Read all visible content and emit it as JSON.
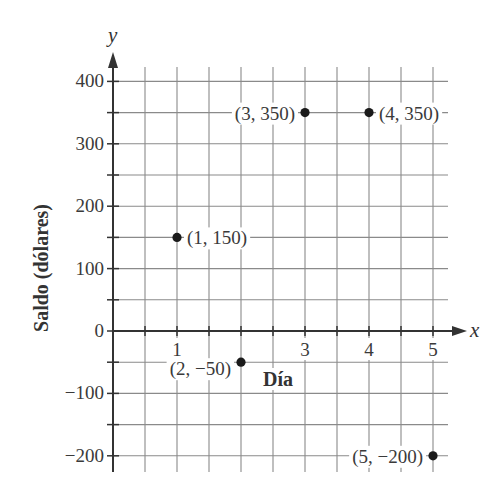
{
  "chart_data": {
    "type": "scatter",
    "title": "",
    "xlabel": "Día",
    "ylabel": "Saldo (dólares)",
    "x_axis_var": "x",
    "y_axis_var": "y",
    "xlim": [
      0,
      5.5
    ],
    "ylim": [
      -225,
      425
    ],
    "x_ticks": [
      1,
      3,
      4,
      5
    ],
    "y_ticks": [
      400,
      300,
      200,
      100,
      0,
      -100,
      -200
    ],
    "y_tick_labels": [
      "400",
      "300",
      "200",
      "100",
      "0",
      "−100",
      "−200"
    ],
    "grid": true,
    "points": [
      {
        "x": 1,
        "y": 150,
        "label": "(1, 150)"
      },
      {
        "x": 2,
        "y": -50,
        "label": "(2, −50)"
      },
      {
        "x": 3,
        "y": 350,
        "label": "(3, 350)"
      },
      {
        "x": 4,
        "y": 350,
        "label": "(4, 350)"
      },
      {
        "x": 5,
        "y": -200,
        "label": "(5, −200)"
      }
    ]
  },
  "colors": {
    "grid": "#8a8a8a",
    "axis": "#333333",
    "point": "#1a1a1a",
    "text": "#3a3a3a"
  }
}
